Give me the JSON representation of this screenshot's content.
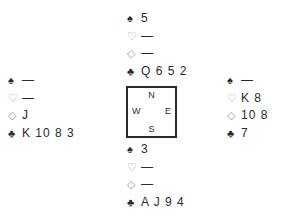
{
  "suits": {
    "spades": "♠",
    "hearts": "♡",
    "diamonds": "◇",
    "clubs": "♣"
  },
  "hands": {
    "north": {
      "spades": "5",
      "hearts": "—",
      "diamonds": "—",
      "clubs": "Q 6 5 2"
    },
    "west": {
      "spades": "—",
      "hearts": "—",
      "diamonds": "J",
      "clubs": "K 10 8 3"
    },
    "east": {
      "spades": "—",
      "hearts": "K 8",
      "diamonds": "10 8",
      "clubs": "7"
    },
    "south": {
      "spades": "3",
      "hearts": "—",
      "diamonds": "—",
      "clubs": "A J 9 4"
    }
  },
  "compass": {
    "north": "N",
    "south": "S",
    "west": "W",
    "east": "E"
  }
}
